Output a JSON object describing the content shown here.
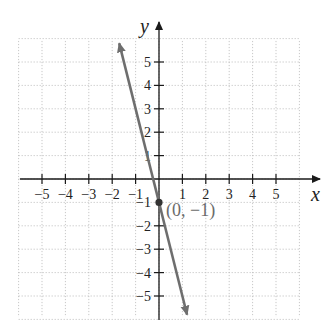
{
  "chart_data": {
    "type": "line",
    "title": "",
    "xlabel": "x",
    "ylabel": "y",
    "xlim": [
      -6,
      6
    ],
    "ylim": [
      -6,
      6
    ],
    "grid": true,
    "x_ticks": [
      -5,
      -4,
      -3,
      -2,
      -1,
      1,
      2,
      3,
      4,
      5
    ],
    "y_ticks": [
      -5,
      -4,
      -3,
      -2,
      -1,
      1,
      2,
      3,
      4,
      5
    ],
    "x_tick_labels": [
      "−5",
      "−4",
      "−3",
      "−2",
      "−1",
      "1",
      "2",
      "3",
      "4",
      "5"
    ],
    "y_tick_labels": [
      "−5",
      "−4",
      "−3",
      "−2",
      "−1",
      "1",
      "2",
      "3",
      "4",
      "5"
    ],
    "series": [
      {
        "name": "y = -4x - 1",
        "slope": -4,
        "intercept": -1,
        "x": [
          -1.7,
          1.2
        ],
        "y": [
          5.8,
          -5.8
        ],
        "color": "#6e6e6e",
        "arrows": "both"
      }
    ],
    "points": [
      {
        "x": 0,
        "y": -1,
        "label": "(0, −1)",
        "color": "#333333"
      }
    ],
    "annotations": [
      "(0, −1)"
    ]
  },
  "labels": {
    "x_axis": "x",
    "y_axis": "y",
    "point": "(0, −1)"
  }
}
